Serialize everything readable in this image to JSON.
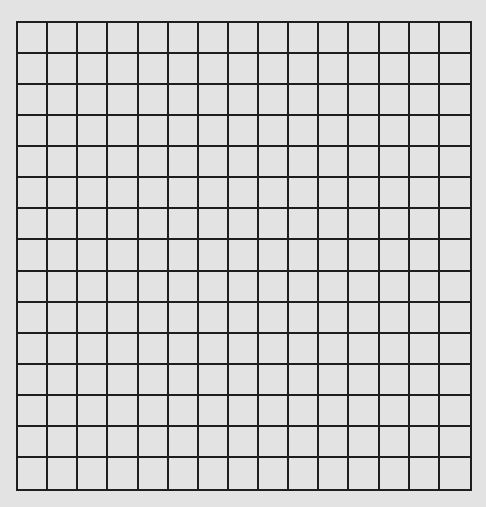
{
  "grid": {
    "rows": 15,
    "cols": 15,
    "background": "#e3e3e3",
    "line_color": "#1e1e1e"
  }
}
